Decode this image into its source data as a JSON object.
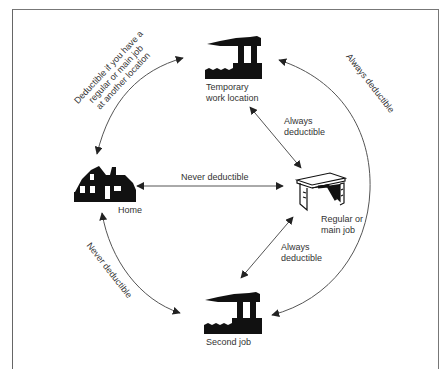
{
  "nodes": {
    "temporary": {
      "line1": "Temporary",
      "line2": "work location",
      "icon": "factory-icon"
    },
    "home": {
      "label": "Home",
      "icon": "house-icon"
    },
    "regular": {
      "line1": "Regular or",
      "line2": "main job",
      "icon": "desk-icon"
    },
    "second": {
      "label": "Second job",
      "icon": "factory-icon"
    }
  },
  "edges": {
    "home_temporary": {
      "line1": "Deductible if you have a",
      "line2": "regular or main job",
      "line3": "at another location"
    },
    "temporary_regular": {
      "line1": "Always",
      "line2": "deductible"
    },
    "home_regular": {
      "label": "Never deductible"
    },
    "regular_second": {
      "line1": "Always",
      "line2": "deductible"
    },
    "temporary_second": {
      "label": "Always deductible"
    },
    "home_second": {
      "label": "Never deductible"
    }
  },
  "colors": {
    "ink": "#111111",
    "line": "#555555",
    "text": "#333333",
    "frame": "#777777"
  }
}
